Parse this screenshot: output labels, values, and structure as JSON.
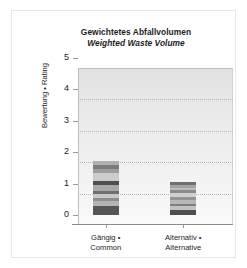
{
  "chart_data": {
    "type": "bar",
    "title": "Gewichtetes Abfallvolumen",
    "subtitle": "Weighted Waste Volume",
    "xlabel": "",
    "ylabel": "Bewertung • Rating",
    "ylim": [
      0,
      5
    ],
    "yticks": [
      "0",
      "1",
      "2",
      "3",
      "4",
      "5"
    ],
    "grid": "horizontal-dotted",
    "legend": "none",
    "stacked": true,
    "categories": [
      {
        "line1": "Gängig •",
        "line2": "Common"
      },
      {
        "line1": "Alternativ •",
        "line2": "Alternative"
      }
    ],
    "values": [
      1.72,
      1.05
    ],
    "series": [
      {
        "name": "Gängig • Common",
        "total": 1.72,
        "segments": [
          {
            "value": 0.27,
            "color": "#555555"
          },
          {
            "value": 0.16,
            "color": "#b4b4b4"
          },
          {
            "value": 0.1,
            "color": "#8e8e8e"
          },
          {
            "value": 0.13,
            "color": "#c8c8c8"
          },
          {
            "value": 0.09,
            "color": "#6e6e6e"
          },
          {
            "value": 0.2,
            "color": "#a8a8a8"
          },
          {
            "value": 0.13,
            "color": "#4f4f4f"
          },
          {
            "value": 0.26,
            "color": "#cccccc"
          },
          {
            "value": 0.11,
            "color": "#9d9d9d"
          },
          {
            "value": 0.13,
            "color": "#7c7c7c"
          },
          {
            "value": 0.14,
            "color": "#b0b0b0"
          }
        ]
      },
      {
        "name": "Alternativ • Alternative",
        "total": 1.05,
        "segments": [
          {
            "value": 0.26,
            "color": "#4f4f4f"
          },
          {
            "value": 0.11,
            "color": "#c2c2c2"
          },
          {
            "value": 0.09,
            "color": "#7f7f7f"
          },
          {
            "value": 0.11,
            "color": "#b8b8b8"
          },
          {
            "value": 0.1,
            "color": "#949494"
          },
          {
            "value": 0.12,
            "color": "#d0d0d0"
          },
          {
            "value": 0.09,
            "color": "#8a8a8a"
          },
          {
            "value": 0.08,
            "color": "#bdbdbd"
          },
          {
            "value": 0.09,
            "color": "#a3a3a3"
          },
          {
            "value": 0.1,
            "color": "#707070"
          }
        ]
      }
    ]
  }
}
